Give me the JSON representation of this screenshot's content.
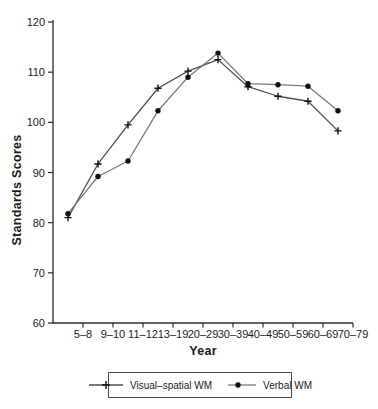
{
  "figure": {
    "background_color": "#ffffff",
    "text_color": "#1c1c1c",
    "axis_color": "#2a2a2a",
    "marker_color": "#111111"
  },
  "chart_data": {
    "type": "line",
    "title": "",
    "xlabel": "Year",
    "ylabel": "Standards Scores",
    "categories": [
      "5–8",
      "9–10",
      "11–12",
      "13–19",
      "20–29",
      "30–39",
      "40–49",
      "50–59",
      "60–69",
      "70–79"
    ],
    "ylim": [
      60,
      120
    ],
    "yticks": [
      60,
      70,
      80,
      90,
      100,
      110,
      120
    ],
    "grid": false,
    "legend_position": "bottom-boxed",
    "point_alignment": "half-step-left-of-tick",
    "series": [
      {
        "name": "Visual–spatial WM",
        "marker": "plus",
        "color": "#4f4f4f",
        "values": [
          81.0,
          91.7,
          99.5,
          106.8,
          110.2,
          112.5,
          107.1,
          105.2,
          104.2,
          98.3
        ]
      },
      {
        "name": "Verbal WM",
        "marker": "filled-circle",
        "color": "#7a7a7a",
        "values": [
          81.8,
          89.2,
          92.3,
          102.3,
          109.0,
          113.8,
          107.7,
          107.5,
          107.2,
          102.3
        ]
      }
    ]
  }
}
